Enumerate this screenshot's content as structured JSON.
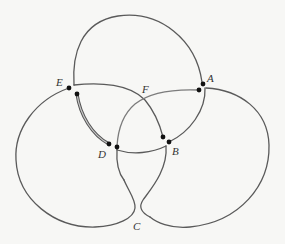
{
  "diagram": {
    "background": "#f7f7f5",
    "stroke_color": "#5a5a5a",
    "dot_color": "#111111",
    "labels": {
      "A": "A",
      "B": "B",
      "C": "C",
      "D": "D",
      "E": "E",
      "F": "F"
    },
    "vertices": [
      {
        "name": "A",
        "dots": 2
      },
      {
        "name": "B",
        "dots": 2
      },
      {
        "name": "C",
        "dots": 0
      },
      {
        "name": "D",
        "dots": 2
      },
      {
        "name": "E",
        "dots": 2
      },
      {
        "name": "F",
        "dots": 0
      }
    ],
    "highlighted_edge": {
      "from": "E",
      "to": "D",
      "style": "double-line"
    }
  }
}
